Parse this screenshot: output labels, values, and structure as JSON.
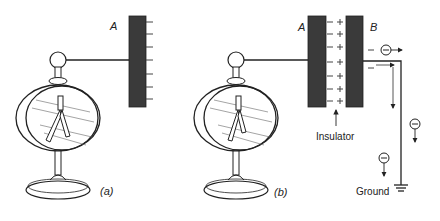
{
  "figure": {
    "panel_a": {
      "caption": "(a)",
      "plate_label": "A",
      "plate_charge_symbol": "−",
      "plate_charge_count": 7
    },
    "panel_b": {
      "caption": "(b)",
      "plate_a_label": "A",
      "plate_b_label": "B",
      "inner_a_charge_symbol": "−",
      "inner_b_charge_symbol": "+",
      "charge_pair_count": 7,
      "outer_b_charge_symbol": "−",
      "insulator_label": "Insulator",
      "ground_label": "Ground",
      "electron_symbol": "−"
    },
    "colors": {
      "plate": "#3a3a3a",
      "line": "#222222",
      "background": "#ffffff"
    }
  }
}
